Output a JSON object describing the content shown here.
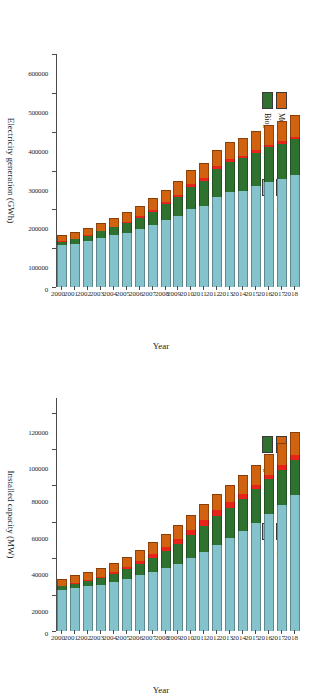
{
  "figure": {
    "orientation_note": "rotated",
    "series_colors": {
      "municipal_waste": "#d1620f",
      "liquid_biofuels": "#e8231a",
      "biogas": "#2f7230",
      "solid_biofuels": "#84c3cc"
    },
    "legend": {
      "items": [
        {
          "key": "municipal_waste",
          "label": "Muncipal Waste",
          "color": "#d1620f"
        },
        {
          "key": "liquid_biofuels",
          "label": "Liquid Biofuels",
          "color": "#e8231a"
        },
        {
          "key": "biogas",
          "label": "Biogas",
          "color": "#2f7230"
        },
        {
          "key": "solid_biofuels",
          "label": "Solid Biofuels",
          "color": "#84c3cc"
        }
      ]
    }
  },
  "chart_data": [
    {
      "id": "generation",
      "type": "bar",
      "orientation": "horizontal",
      "stacked": true,
      "title": "",
      "xlabel": "Electricity generation (GWh)",
      "ylabel": "Year",
      "xlim": [
        0,
        600000
      ],
      "xticks": [
        0,
        100000,
        200000,
        300000,
        400000,
        500000,
        600000
      ],
      "xticklabels": [
        "0",
        "100000",
        "200000",
        "300000",
        "400000",
        "500000",
        "600000"
      ],
      "grid": false,
      "legend_position": "upper-left",
      "categories": [
        "2000",
        "2001",
        "2002",
        "2003",
        "2004",
        "2005",
        "2006",
        "2007",
        "2008",
        "2009",
        "2010",
        "2011",
        "2012",
        "2013",
        "2014",
        "2015",
        "2016",
        "2017",
        "2018"
      ],
      "series": [
        {
          "name": "Solid Biofuels",
          "color": "#84c3cc",
          "values": [
            108000,
            112000,
            118000,
            126000,
            133000,
            140000,
            150000,
            160000,
            172000,
            183000,
            200000,
            208000,
            231000,
            244000,
            248000,
            259000,
            271000,
            278000,
            288000
          ]
        },
        {
          "name": "Biogas",
          "color": "#2f7230",
          "values": [
            9000,
            11000,
            14000,
            17000,
            21000,
            25000,
            29000,
            34000,
            41000,
            49000,
            58000,
            66000,
            73000,
            79000,
            83000,
            87000,
            89000,
            91000,
            93000
          ]
        },
        {
          "name": "Liquid Biofuels",
          "color": "#e8231a",
          "values": [
            800,
            900,
            1100,
            1400,
            1800,
            2300,
            3200,
            4200,
            5200,
            6100,
            6800,
            7200,
            7600,
            7900,
            7600,
            7200,
            6900,
            6700,
            6600
          ]
        },
        {
          "name": "Muncipal Waste",
          "color": "#d1620f",
          "values": [
            16000,
            17500,
            19000,
            21000,
            23000,
            25000,
            27500,
            30000,
            32500,
            35000,
            37000,
            39000,
            41000,
            43000,
            45500,
            47500,
            50000,
            52500,
            55000
          ]
        }
      ],
      "totals": [
        133800,
        141400,
        152100,
        165400,
        178800,
        192300,
        209700,
        228200,
        250700,
        273100,
        301800,
        320200,
        352600,
        373900,
        384100,
        400700,
        416900,
        428200,
        442600
      ]
    },
    {
      "id": "capacity",
      "type": "bar",
      "orientation": "horizontal",
      "stacked": true,
      "title": "",
      "xlabel": "Installed capacity (MW)",
      "ylabel": "Year",
      "xlim": [
        0,
        128000
      ],
      "xticks": [
        0,
        20000,
        40000,
        60000,
        80000,
        100000,
        120000
      ],
      "xticklabels": [
        "0",
        "20000",
        "40000",
        "60000",
        "80000",
        "100000",
        "120000"
      ],
      "grid": false,
      "legend_position": "upper-left",
      "categories": [
        "2000",
        "2001",
        "2002",
        "2003",
        "2004",
        "2005",
        "2006",
        "2007",
        "2008",
        "2009",
        "2010",
        "2011",
        "2012",
        "2013",
        "2014",
        "2015",
        "2016",
        "2017",
        "2018"
      ],
      "series": [
        {
          "name": "Solid Biofuels",
          "color": "#84c3cc",
          "values": [
            22500,
            23500,
            24500,
            25500,
            27000,
            28500,
            30500,
            32500,
            34500,
            37000,
            40000,
            43500,
            47500,
            51000,
            55000,
            59500,
            64500,
            69500,
            74500
          ]
        },
        {
          "name": "Biogas",
          "color": "#2f7230",
          "values": [
            2000,
            2400,
            3000,
            3600,
            4400,
            5300,
            6400,
            7600,
            9200,
            10800,
            12600,
            14400,
            15800,
            16800,
            17600,
            18300,
            18800,
            19200,
            19600
          ]
        },
        {
          "name": "Liquid Biofuels",
          "color": "#e8231a",
          "values": [
            400,
            450,
            550,
            700,
            900,
            1200,
            1600,
            2000,
            2400,
            2700,
            2900,
            3000,
            3000,
            2900,
            2800,
            2700,
            2600,
            2500,
            2400
          ]
        },
        {
          "name": "Muncipal Waste",
          "color": "#d1620f",
          "values": [
            3900,
            4200,
            4500,
            4900,
            5300,
            5700,
            6200,
            6700,
            7200,
            7700,
            8200,
            8700,
            9200,
            9700,
            10300,
            10900,
            11600,
            12300,
            13000
          ]
        }
      ],
      "totals": [
        28800,
        30550,
        32550,
        34700,
        37600,
        40700,
        44700,
        48800,
        53300,
        58200,
        63700,
        69600,
        75500,
        80400,
        85700,
        91400,
        97500,
        103500,
        109500
      ]
    }
  ]
}
